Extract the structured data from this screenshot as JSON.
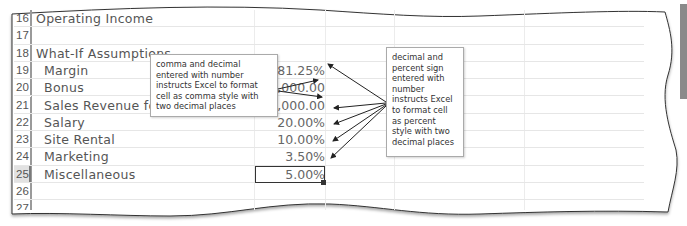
{
  "spreadsheet": {
    "rows": [
      {
        "num": "16",
        "label": "Operating Income",
        "indent": 1,
        "value": ""
      },
      {
        "num": "17",
        "label": "",
        "indent": 1,
        "value": ""
      },
      {
        "num": "18",
        "label": "What-If Assumptions",
        "indent": 1,
        "value": ""
      },
      {
        "num": "19",
        "label": "Margin",
        "indent": 2,
        "value": "81.25%"
      },
      {
        "num": "20",
        "label": "Bonus",
        "indent": 2,
        "value": "5,000.00"
      },
      {
        "num": "21",
        "label": "Sales Revenue for Bonus",
        "indent": 2,
        "value": "1,250,000.00"
      },
      {
        "num": "22",
        "label": "Salary",
        "indent": 2,
        "value": "20.00%"
      },
      {
        "num": "23",
        "label": "Site Rental",
        "indent": 2,
        "value": "10.00%"
      },
      {
        "num": "24",
        "label": "Marketing",
        "indent": 2,
        "value": "3.50%"
      },
      {
        "num": "25",
        "label": "Miscellaneous",
        "indent": 2,
        "value": "5.00%"
      },
      {
        "num": "26",
        "label": "",
        "indent": 1,
        "value": ""
      },
      {
        "num": "27",
        "label": "",
        "indent": 1,
        "value": ""
      },
      {
        "num": "28",
        "label": "",
        "indent": 1,
        "value": ""
      }
    ],
    "active_row": "25",
    "active_cell_value": "5.00%"
  },
  "callouts": {
    "comma_note": "comma and decimal entered with number instructs Excel to format cell as comma style with two decimal places",
    "percent_note": "decimal and percent sign entered with number instructs Excel to format cell as percent style with two decimal places"
  },
  "colors": {
    "text": "#555555",
    "gridline": "#e6e6e6",
    "selection_border": "#333333",
    "side_tab": "#8a8a8a"
  }
}
